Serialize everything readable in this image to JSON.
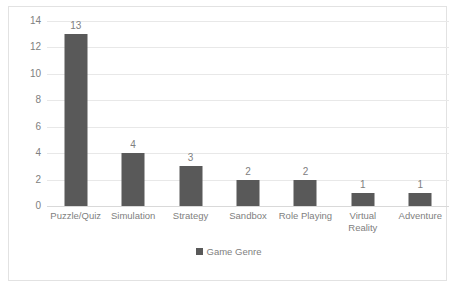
{
  "chart_data": {
    "type": "bar",
    "title": "",
    "xlabel": "",
    "ylabel": "",
    "categories": [
      "Puzzle/Quiz",
      "Simulation",
      "Strategy",
      "Sandbox",
      "Role Playing",
      "Virtual Reality",
      "Adventure"
    ],
    "values": [
      13,
      4,
      3,
      2,
      2,
      1,
      1
    ],
    "data_labels": [
      "13",
      "4",
      "3",
      "2",
      "2",
      "1",
      "1"
    ],
    "series": [
      {
        "name": "Game Genre",
        "values": [
          13,
          4,
          3,
          2,
          2,
          1,
          1
        ]
      }
    ],
    "ylim": [
      0,
      14
    ],
    "yticks": [
      0,
      2,
      4,
      6,
      8,
      10,
      12,
      14
    ],
    "ytick_labels": [
      "0",
      "2",
      "4",
      "6",
      "8",
      "10",
      "12",
      "14"
    ],
    "grid": true,
    "legend": {
      "position": "bottom",
      "entries": [
        "Game Genre"
      ]
    },
    "colors": {
      "bar": "#595959",
      "gridline": "#e8e8e8",
      "axis": "#d9d9d9",
      "text": "#808080",
      "border": "#e2e2e2",
      "background": "#ffffff"
    }
  }
}
